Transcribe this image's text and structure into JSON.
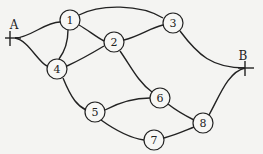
{
  "diagram": {
    "type": "graph",
    "terminals": [
      {
        "id": "A",
        "label": "A",
        "x": 15,
        "y": 38
      },
      {
        "id": "B",
        "label": "B",
        "x": 245,
        "y": 68
      }
    ],
    "nodes": [
      {
        "id": "1",
        "label": "1",
        "x": 70,
        "y": 20
      },
      {
        "id": "2",
        "label": "2",
        "x": 114,
        "y": 42
      },
      {
        "id": "3",
        "label": "3",
        "x": 173,
        "y": 23
      },
      {
        "id": "4",
        "label": "4",
        "x": 57,
        "y": 69
      },
      {
        "id": "5",
        "label": "5",
        "x": 95,
        "y": 112
      },
      {
        "id": "6",
        "label": "6",
        "x": 160,
        "y": 98
      },
      {
        "id": "7",
        "label": "7",
        "x": 154,
        "y": 140
      },
      {
        "id": "8",
        "label": "8",
        "x": 203,
        "y": 123
      }
    ],
    "edges": [
      [
        "A",
        "1"
      ],
      [
        "A",
        "4"
      ],
      [
        "1",
        "4"
      ],
      [
        "1",
        "2"
      ],
      [
        "1",
        "3"
      ],
      [
        "4",
        "2"
      ],
      [
        "2",
        "3"
      ],
      [
        "2",
        "6"
      ],
      [
        "3",
        "B"
      ],
      [
        "4",
        "5"
      ],
      [
        "5",
        "6"
      ],
      [
        "5",
        "7"
      ],
      [
        "6",
        "8"
      ],
      [
        "7",
        "8"
      ],
      [
        "8",
        "B"
      ]
    ]
  }
}
